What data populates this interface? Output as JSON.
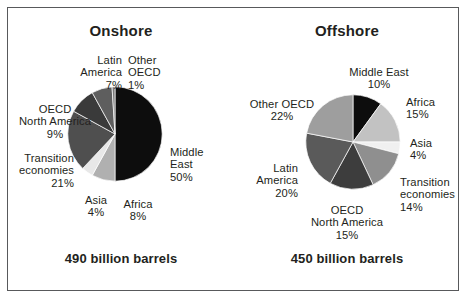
{
  "figure": {
    "border_color": "#58595b",
    "background": "#ffffff"
  },
  "panels": {
    "onshore": {
      "title": "Onshore",
      "caption": "490 billion barrels"
    },
    "offshore": {
      "title": "Offshore",
      "caption": "450 billion barrels"
    }
  },
  "chart_data": [
    {
      "type": "pie",
      "title": "Onshore",
      "subtitle": "490 billion barrels",
      "unit": "percent of reserves",
      "total_label": "490 billion barrels",
      "start_angle_deg": 0,
      "direction": "clockwise",
      "categories": [
        "Middle East",
        "Africa",
        "Asia",
        "Transition economies",
        "OECD North America",
        "Latin America",
        "Other OECD"
      ],
      "values": [
        50,
        8,
        4,
        21,
        9,
        7,
        1
      ],
      "value_labels": [
        "50%",
        "8%",
        "4%",
        "21%",
        "9%",
        "7%",
        "1%"
      ],
      "colors": [
        "#0d0d0d",
        "#b0b0b0",
        "#e8e8e8",
        "#4f4f4f",
        "#3a3a3a",
        "#5e5e5e",
        "#7a7a7a"
      ],
      "labels": [
        {
          "name": "Middle East",
          "lines": [
            "Middle",
            "East"
          ],
          "pct": "50%"
        },
        {
          "name": "Africa",
          "lines": [
            "Africa"
          ],
          "pct": "8%"
        },
        {
          "name": "Asia",
          "lines": [
            "Asia"
          ],
          "pct": "4%"
        },
        {
          "name": "Transition economies",
          "lines": [
            "Transition",
            "economies"
          ],
          "pct": "21%"
        },
        {
          "name": "OECD North America",
          "lines": [
            "OECD",
            "North America"
          ],
          "pct": "9%"
        },
        {
          "name": "Latin America",
          "lines": [
            "Latin",
            "America"
          ],
          "pct": "7%"
        },
        {
          "name": "Other OECD",
          "lines": [
            "Other",
            "OECD"
          ],
          "pct": "1%"
        }
      ]
    },
    {
      "type": "pie",
      "title": "Offshore",
      "subtitle": "450 billion barrels",
      "unit": "percent of reserves",
      "total_label": "450 billion barrels",
      "start_angle_deg": 0,
      "direction": "clockwise",
      "categories": [
        "Middle East",
        "Africa",
        "Asia",
        "Transition economies",
        "OECD North America",
        "Latin America",
        "Other OECD"
      ],
      "values": [
        10,
        15,
        4,
        14,
        15,
        20,
        22
      ],
      "value_labels": [
        "10%",
        "15%",
        "4%",
        "14%",
        "15%",
        "20%",
        "22%"
      ],
      "colors": [
        "#0d0d0d",
        "#c2c2c2",
        "#f0f0f0",
        "#8f8f8f",
        "#3d3d3d",
        "#5a5a5a",
        "#9e9e9e"
      ],
      "labels": [
        {
          "name": "Middle East",
          "lines": [
            "Middle East"
          ],
          "pct": "10%"
        },
        {
          "name": "Africa",
          "lines": [
            "Africa"
          ],
          "pct": "15%"
        },
        {
          "name": "Asia",
          "lines": [
            "Asia"
          ],
          "pct": "4%"
        },
        {
          "name": "Transition economies",
          "lines": [
            "Transition",
            "economies"
          ],
          "pct": "14%"
        },
        {
          "name": "OECD North America",
          "lines": [
            "OECD",
            "North America"
          ],
          "pct": "15%"
        },
        {
          "name": "Latin America",
          "lines": [
            "Latin",
            "America"
          ],
          "pct": "20%"
        },
        {
          "name": "Other OECD",
          "lines": [
            "Other OECD"
          ],
          "pct": "22%"
        }
      ]
    }
  ],
  "onshore_labels": {
    "middle_east_l1": "Middle",
    "middle_east_l2": "East",
    "middle_east_pct": "50%",
    "africa": "Africa",
    "africa_pct": "8%",
    "asia": "Asia",
    "asia_pct": "4%",
    "transition_l1": "Transition",
    "transition_l2": "economies",
    "transition_pct": "21%",
    "oecd_na_l1": "OECD",
    "oecd_na_l2": "North America",
    "oecd_na_pct": "9%",
    "latin_l1": "Latin",
    "latin_l2": "America",
    "latin_pct": "7%",
    "other_oecd_l1": "Other",
    "other_oecd_l2": "OECD",
    "other_oecd_pct": "1%"
  },
  "offshore_labels": {
    "middle_east": "Middle East",
    "middle_east_pct": "10%",
    "africa": "Africa",
    "africa_pct": "15%",
    "asia": "Asia",
    "asia_pct": "4%",
    "transition_l1": "Transition",
    "transition_l2": "economies",
    "transition_pct": "14%",
    "oecd_na_l1": "OECD",
    "oecd_na_l2": "North America",
    "oecd_na_pct": "15%",
    "latin_l1": "Latin",
    "latin_l2": "America",
    "latin_pct": "20%",
    "other_oecd": "Other OECD",
    "other_oecd_pct": "22%"
  }
}
